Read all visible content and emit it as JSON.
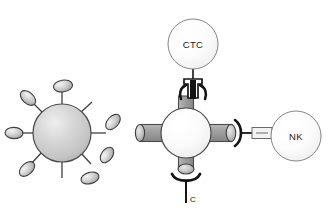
{
  "figure": {
    "background_color": "#ffffff",
    "width": 334,
    "height": 222
  },
  "palette": {
    "outline": "#3a3a3a",
    "dark_outline": "#111111",
    "virus_body_light": "#e4e4e4",
    "virus_body_mid": "#c9c9c9",
    "virus_body_dark": "#a8a8a8",
    "spike_light": "#ececec",
    "spike_mid": "#c4c4c4",
    "spike_dark": "#9a9a9a",
    "hub_light": "#ffffff",
    "hub_mid": "#f2f2f2",
    "hub_dark": "#d8d8d8",
    "arm_light": "#b5b5b5",
    "arm_mid": "#9e9e9e",
    "arm_dark": "#8a8a8a",
    "cell_light": "#ffffff",
    "cell_mid": "#f5f5f5",
    "cell_dark": "#dcdcdc",
    "linker": "#141414"
  },
  "panels": {
    "left": {
      "name": "virus-particle",
      "description": "Spiked viral nanoparticle with surface ligands",
      "center": {
        "x": 62,
        "y": 133
      },
      "body_radius": 29,
      "spikes": [
        {
          "angle": -90,
          "stalk": 22,
          "cap_rx": 9.5,
          "cap_ry": 6.0,
          "cap_rot": -8
        },
        {
          "angle": -137,
          "stalk": 19,
          "cap_rx": 9.0,
          "cap_ry": 5.5,
          "cap_rot": 40
        },
        {
          "angle": 180,
          "stalk": 20,
          "cap_rx": 9.0,
          "cap_ry": 5.5,
          "cap_rot": 0
        },
        {
          "angle": 132,
          "stalk": 19,
          "cap_rx": 9.0,
          "cap_ry": 5.5,
          "cap_rot": -40
        },
        {
          "angle": 90,
          "stalk": 20,
          "cap_rx": 0,
          "cap_ry": 0,
          "cap_rot": 0
        },
        {
          "angle": 53,
          "stalk": 19,
          "cap_rx": 0,
          "cap_ry": 0,
          "cap_rot": 0
        },
        {
          "angle": 0,
          "stalk": 21,
          "cap_rx": 0,
          "cap_ry": 0,
          "cap_rot": 0
        },
        {
          "angle": -47,
          "stalk": 20,
          "cap_rx": 0,
          "cap_ry": 0,
          "cap_rot": 0
        }
      ],
      "free_ligands": [
        {
          "x": 113,
          "y": 123,
          "rx": 9.0,
          "ry": 5.5,
          "rot": -48
        },
        {
          "x": 107,
          "y": 155,
          "rx": 8.5,
          "ry": 5.5,
          "rot": -52
        },
        {
          "x": 90,
          "y": 177,
          "rx": 9.0,
          "ry": 5.5,
          "rot": -16
        }
      ]
    },
    "right": {
      "name": "nanoparticle-conjugate",
      "description": "Central nanoparticle hub with four arms linking a CTC and an NK cell",
      "hub": {
        "x": 186,
        "y": 133,
        "radius": 25
      },
      "arms": [
        {
          "direction": "up",
          "length": 28,
          "width": 17
        },
        {
          "direction": "down",
          "length": 30,
          "width": 17
        },
        {
          "direction": "left",
          "length": 38,
          "width": 17
        },
        {
          "direction": "right",
          "length": 38,
          "width": 17
        }
      ],
      "cells": [
        {
          "id": "ctc",
          "label": "CTC",
          "cx": 193,
          "cy": 44,
          "radius": 25,
          "attached_to": "up-arm",
          "linker": "antibody-clamp"
        },
        {
          "id": "nk",
          "label": "NK",
          "cx": 296,
          "cy": 136,
          "radius": 25,
          "attached_to": "right-arm",
          "linker": "bracket-rod"
        }
      ],
      "free_linkers": [
        {
          "id": "c-linker",
          "label": "C",
          "x": 186,
          "y": 196,
          "type": "bracket-stem"
        }
      ]
    }
  },
  "labels": {
    "ctc": "CTC",
    "nk": "NK",
    "c": "C"
  }
}
